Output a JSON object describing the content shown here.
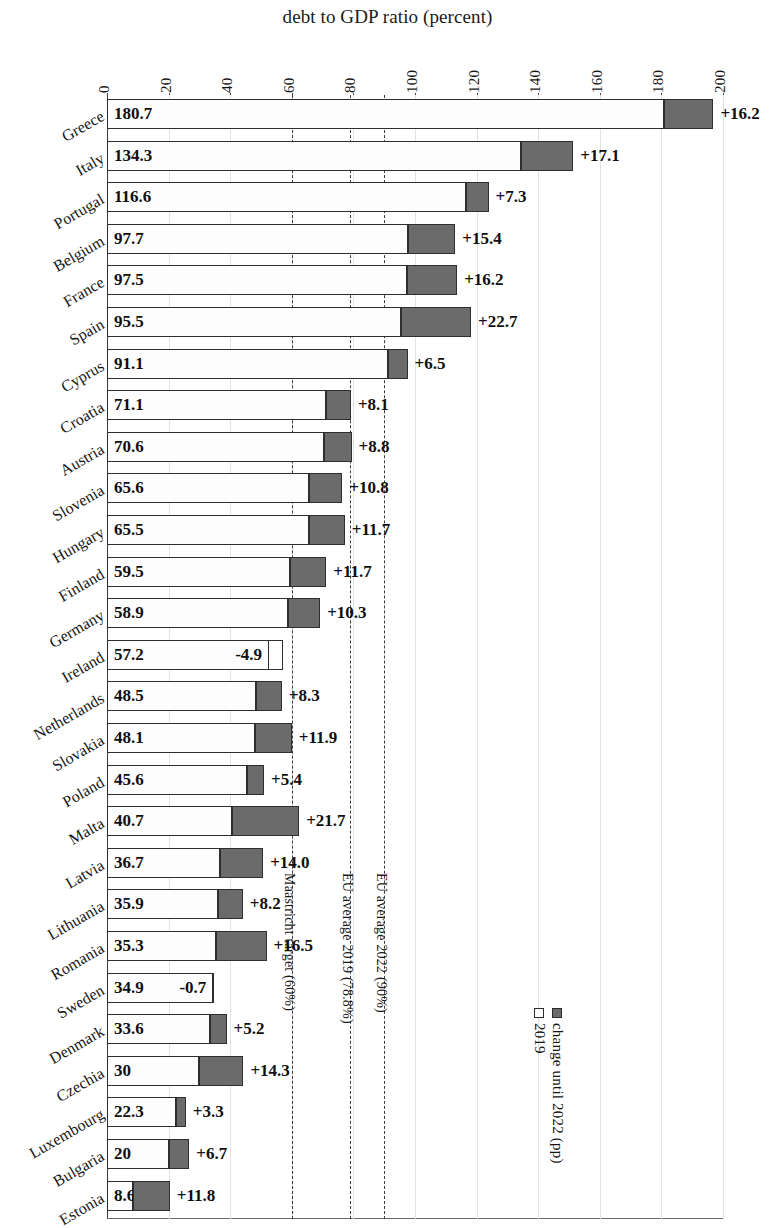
{
  "chart_data": {
    "type": "bar",
    "orientation": "horizontal",
    "stacked": true,
    "title": "debt to GDP ratio (percent)",
    "xlabel": "",
    "ylabel": "",
    "xlim": [
      0,
      200
    ],
    "xticks": [
      0,
      20,
      40,
      60,
      80,
      100,
      120,
      140,
      160,
      180,
      200
    ],
    "grid": true,
    "legend_position": "right-rotated",
    "legend": [
      {
        "label": "2019",
        "swatch": "hollow"
      },
      {
        "label": "change until 2022 (pp)",
        "swatch": "filled"
      }
    ],
    "series": [
      {
        "name": "2019",
        "key": "base"
      },
      {
        "name": "change until 2022 (pp)",
        "key": "change"
      }
    ],
    "categories": [
      "Greece",
      "Italy",
      "Portugal",
      "Belgium",
      "France",
      "Spain",
      "Cyprus",
      "Croatia",
      "Austria",
      "Slovenia",
      "Hungary",
      "Finland",
      "Germany",
      "Ireland",
      "Netherlands",
      "Slovakia",
      "Poland",
      "Malta",
      "Latvia",
      "Lithuania",
      "Romania",
      "Sweden",
      "Denmark",
      "Czechia",
      "Luxembourg",
      "Bulgaria",
      "Estonia"
    ],
    "reference_lines": [
      {
        "value": 60,
        "label": "Maastricht target (60%)"
      },
      {
        "value": 78.8,
        "label": "EU average 2019 (78.8%)"
      },
      {
        "value": 90,
        "label": "EU average 2022 (90%)"
      }
    ],
    "rows": [
      {
        "country": "Greece",
        "base": 180.7,
        "base_label": "180.7",
        "change": 16.2,
        "change_label": "+16.2"
      },
      {
        "country": "Italy",
        "base": 134.3,
        "base_label": "134.3",
        "change": 17.1,
        "change_label": "+17.1"
      },
      {
        "country": "Portugal",
        "base": 116.6,
        "base_label": "116.6",
        "change": 7.3,
        "change_label": "+7.3"
      },
      {
        "country": "Belgium",
        "base": 97.7,
        "base_label": "97.7",
        "change": 15.4,
        "change_label": "+15.4"
      },
      {
        "country": "France",
        "base": 97.5,
        "base_label": "97.5",
        "change": 16.2,
        "change_label": "+16.2"
      },
      {
        "country": "Spain",
        "base": 95.5,
        "base_label": "95.5",
        "change": 22.7,
        "change_label": "+22.7"
      },
      {
        "country": "Cyprus",
        "base": 91.1,
        "base_label": "91.1",
        "change": 6.5,
        "change_label": "+6.5"
      },
      {
        "country": "Croatia",
        "base": 71.1,
        "base_label": "71.1",
        "change": 8.1,
        "change_label": "+8.1"
      },
      {
        "country": "Austria",
        "base": 70.6,
        "base_label": "70.6",
        "change": 8.8,
        "change_label": "+8.8"
      },
      {
        "country": "Slovenia",
        "base": 65.6,
        "base_label": "65.6",
        "change": 10.8,
        "change_label": "+10.8"
      },
      {
        "country": "Hungary",
        "base": 65.5,
        "base_label": "65.5",
        "change": 11.7,
        "change_label": "+11.7"
      },
      {
        "country": "Finland",
        "base": 59.5,
        "base_label": "59.5",
        "change": 11.7,
        "change_label": "+11.7"
      },
      {
        "country": "Germany",
        "base": 58.9,
        "base_label": "58.9",
        "change": 10.3,
        "change_label": "+10.3"
      },
      {
        "country": "Ireland",
        "base": 57.2,
        "base_label": "57.2",
        "change": -4.9,
        "change_label": "-4.9"
      },
      {
        "country": "Netherlands",
        "base": 48.5,
        "base_label": "48.5",
        "change": 8.3,
        "change_label": "+8.3"
      },
      {
        "country": "Slovakia",
        "base": 48.1,
        "base_label": "48.1",
        "change": 11.9,
        "change_label": "+11.9"
      },
      {
        "country": "Poland",
        "base": 45.6,
        "base_label": "45.6",
        "change": 5.4,
        "change_label": "+5.4"
      },
      {
        "country": "Malta",
        "base": 40.7,
        "base_label": "40.7",
        "change": 21.7,
        "change_label": "+21.7"
      },
      {
        "country": "Latvia",
        "base": 36.7,
        "base_label": "36.7",
        "change": 14.0,
        "change_label": "+14.0"
      },
      {
        "country": "Lithuania",
        "base": 35.9,
        "base_label": "35.9",
        "change": 8.2,
        "change_label": "+8.2"
      },
      {
        "country": "Romania",
        "base": 35.3,
        "base_label": "35.3",
        "change": 16.5,
        "change_label": "+16.5"
      },
      {
        "country": "Sweden",
        "base": 34.9,
        "base_label": "34.9",
        "change": -0.7,
        "change_label": "-0.7"
      },
      {
        "country": "Denmark",
        "base": 33.6,
        "base_label": "33.6",
        "change": 5.2,
        "change_label": "+5.2"
      },
      {
        "country": "Czechia",
        "base": 30.0,
        "base_label": "30",
        "change": 14.3,
        "change_label": "+14.3"
      },
      {
        "country": "Luxembourg",
        "base": 22.3,
        "base_label": "22.3",
        "change": 3.3,
        "change_label": "+3.3"
      },
      {
        "country": "Bulgaria",
        "base": 20.0,
        "base_label": "20",
        "change": 6.7,
        "change_label": "+6.7"
      },
      {
        "country": "Estonia",
        "base": 8.6,
        "base_label": "8.6",
        "change": 11.8,
        "change_label": "+11.8"
      }
    ]
  }
}
